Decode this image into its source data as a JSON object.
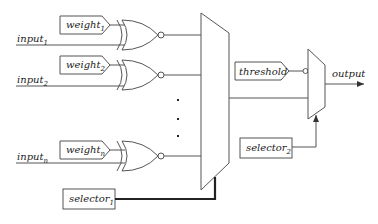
{
  "diagram": {
    "type": "logic-circuit",
    "inputs": [
      {
        "base": "input",
        "sub": "1"
      },
      {
        "base": "input",
        "sub": "2"
      },
      {
        "base": "input",
        "sub": "n"
      }
    ],
    "weights": [
      {
        "base": "weight",
        "sub": "1"
      },
      {
        "base": "weight",
        "sub": "2"
      },
      {
        "base": "weight",
        "sub": "n"
      }
    ],
    "gates": [
      "XNOR",
      "XNOR",
      "XNOR"
    ],
    "ellipsis": "⋮",
    "threshold_label": "threshold",
    "output_label": "output",
    "selectors": [
      {
        "base": "selector",
        "sub": "1"
      },
      {
        "base": "selector",
        "sub": "2"
      }
    ]
  }
}
